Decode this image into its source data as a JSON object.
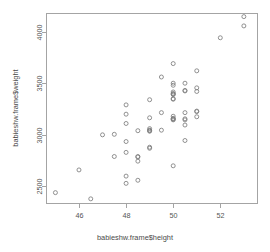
{
  "chart_data": {
    "type": "scatter",
    "title": "",
    "xlabel": "babieshw.frame$height",
    "ylabel": "babieshw.frame$weight",
    "xlim": [
      44.6,
      53.6
    ],
    "ylim": [
      2330,
      4180
    ],
    "xticks": [
      46,
      48,
      50,
      52
    ],
    "yticks": [
      2500,
      3000,
      3500,
      4000
    ],
    "xtick_labels": [
      "46",
      "48",
      "50",
      "52"
    ],
    "ytick_labels": [
      "2500",
      "3000",
      "3500",
      "4000"
    ],
    "grid": false,
    "legend": null,
    "marker": "open-circle",
    "marker_color": "#7d7d7d",
    "points": [
      [
        45.0,
        2440
      ],
      [
        46.0,
        2660
      ],
      [
        46.5,
        2380
      ],
      [
        47.0,
        3000
      ],
      [
        47.5,
        3005
      ],
      [
        47.5,
        2790
      ],
      [
        48.0,
        3290
      ],
      [
        48.0,
        3200
      ],
      [
        48.0,
        3110
      ],
      [
        48.0,
        2935
      ],
      [
        48.0,
        2830
      ],
      [
        48.0,
        2600
      ],
      [
        48.0,
        2530
      ],
      [
        48.5,
        3040
      ],
      [
        48.5,
        2790
      ],
      [
        48.5,
        2785
      ],
      [
        48.5,
        2745
      ],
      [
        48.5,
        2560
      ],
      [
        49.0,
        3340
      ],
      [
        49.0,
        3165
      ],
      [
        49.0,
        3060
      ],
      [
        49.0,
        3045
      ],
      [
        49.0,
        3040
      ],
      [
        49.0,
        3035
      ],
      [
        49.0,
        2880
      ],
      [
        49.0,
        2870
      ],
      [
        49.5,
        3560
      ],
      [
        49.5,
        3215
      ],
      [
        49.5,
        3045
      ],
      [
        50.0,
        3690
      ],
      [
        50.0,
        3500
      ],
      [
        50.0,
        3480
      ],
      [
        50.0,
        3415
      ],
      [
        50.0,
        3400
      ],
      [
        50.0,
        3395
      ],
      [
        50.0,
        3390
      ],
      [
        50.0,
        3350
      ],
      [
        50.0,
        3345
      ],
      [
        50.0,
        3180
      ],
      [
        50.0,
        3160
      ],
      [
        50.0,
        3155
      ],
      [
        50.0,
        3150
      ],
      [
        50.0,
        3145
      ],
      [
        50.0,
        2700
      ],
      [
        50.5,
        3500
      ],
      [
        50.5,
        3430
      ],
      [
        50.5,
        3425
      ],
      [
        50.5,
        3215
      ],
      [
        50.5,
        3155
      ],
      [
        50.5,
        3145
      ],
      [
        50.5,
        3095
      ],
      [
        50.5,
        2945
      ],
      [
        51.0,
        3620
      ],
      [
        51.0,
        3455
      ],
      [
        51.0,
        3420
      ],
      [
        51.0,
        3230
      ],
      [
        51.0,
        3225
      ],
      [
        51.0,
        3175
      ],
      [
        52.0,
        3940
      ],
      [
        53.0,
        4145
      ],
      [
        53.0,
        4055
      ]
    ]
  },
  "plot_geometry": {
    "panel": {
      "x": 46,
      "y": 13,
      "width": 212,
      "height": 191
    },
    "note_units": "pixels"
  }
}
